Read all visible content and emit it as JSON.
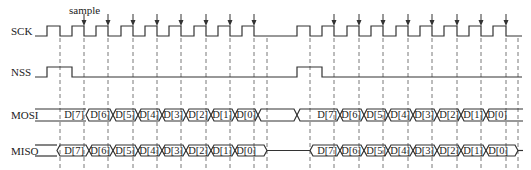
{
  "diagram": {
    "type": "spi-timing-diagram",
    "annotation": "sample",
    "signals": [
      {
        "name": "SCK"
      },
      {
        "name": "NSS"
      },
      {
        "name": "MOSI"
      },
      {
        "name": "MISO"
      }
    ],
    "frame1_bits": [
      "D[7]",
      "D[6]",
      "D[5]",
      "D[4]",
      "D[3]",
      "D[2]",
      "D[1]",
      "D[0]"
    ],
    "frame2_bits": [
      "D[7]",
      "D[6]",
      "D[5]",
      "D[4]",
      "D[3]",
      "D[2]",
      "D[1]",
      "D[0]"
    ],
    "colors": {
      "line": "#333333",
      "dash": "#555555",
      "text": "#222222",
      "background": "#ffffff"
    }
  }
}
